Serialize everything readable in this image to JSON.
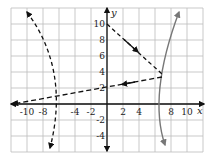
{
  "chart_data": {
    "type": "line",
    "title": "",
    "xlabel": "x",
    "ylabel": "y",
    "xlim": [
      -12,
      12
    ],
    "ylim": [
      -6,
      12
    ],
    "grid": true,
    "grid_step": 2,
    "x_ticks": [
      "-10",
      "-8",
      "-4",
      "-2",
      "2",
      "4",
      "8",
      "10"
    ],
    "y_ticks": [
      "10",
      "8",
      "6",
      "4",
      "2",
      "-2",
      "-4"
    ],
    "series": [
      {
        "name": "gray parabola (opens right)",
        "style": "solid",
        "color": "#777777",
        "points": [
          [
            7.3,
            -5.2
          ],
          [
            6,
            -1
          ],
          [
            6.2,
            2
          ],
          [
            7,
            4
          ],
          [
            9,
            11.5
          ]
        ]
      },
      {
        "name": "left dashed curve (opens left)",
        "style": "dashed",
        "color": "#111111",
        "points": [
          [
            -10,
            11.5
          ],
          [
            -6,
            1
          ],
          [
            -7,
            -5.5
          ]
        ]
      },
      {
        "name": "dashed segment from (0,10)",
        "style": "dashed",
        "color": "#111111",
        "points": [
          [
            0,
            10
          ],
          [
            7,
            3.8
          ]
        ],
        "arrow_mid": [
          4,
          6.2
        ]
      },
      {
        "name": "dashed line y = 2 + 0.2x",
        "style": "dashed",
        "color": "#111111",
        "points": [
          [
            7,
            3.4
          ],
          [
            0,
            2
          ],
          [
            -10,
            0
          ]
        ],
        "arrow_mid": [
          2,
          2.4
        ]
      }
    ]
  },
  "labels": {
    "x_axis": "x",
    "y_axis": "y",
    "x_ticks": [
      {
        "v": -10,
        "t": "-10"
      },
      {
        "v": -8,
        "t": "-8"
      },
      {
        "v": -4,
        "t": "-4"
      },
      {
        "v": -2,
        "t": "-2"
      },
      {
        "v": 2,
        "t": "2"
      },
      {
        "v": 4,
        "t": "4"
      },
      {
        "v": 8,
        "t": "8"
      },
      {
        "v": 10,
        "t": "10"
      }
    ],
    "y_ticks": [
      {
        "v": 10,
        "t": "10"
      },
      {
        "v": 8,
        "t": "8"
      },
      {
        "v": 6,
        "t": "6"
      },
      {
        "v": 4,
        "t": "4"
      },
      {
        "v": 2,
        "t": "2"
      },
      {
        "v": -2,
        "t": "-2"
      },
      {
        "v": -4,
        "t": "-4"
      }
    ]
  }
}
